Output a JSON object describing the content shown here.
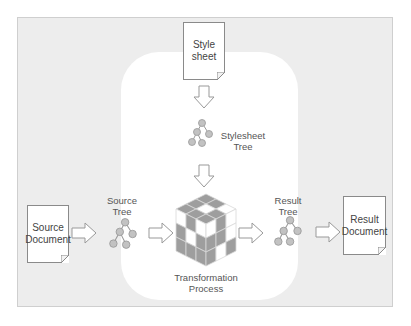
{
  "diagram": {
    "nodes": {
      "stylesheet_doc": {
        "label_line1": "Style",
        "label_line2": "sheet"
      },
      "stylesheet_tree": {
        "label_line1": "Stylesheet",
        "label_line2": "Tree"
      },
      "source_doc": {
        "label_line1": "Source",
        "label_line2": "Document"
      },
      "source_tree": {
        "label_line1": "Source",
        "label_line2": "Tree"
      },
      "transformation": {
        "label_line1": "Transformation",
        "label_line2": "Process"
      },
      "result_tree": {
        "label_line1": "Result",
        "label_line2": "Tree"
      },
      "result_doc": {
        "label_line1": "Result",
        "label_line2": "Document"
      }
    },
    "edges": [
      {
        "from": "stylesheet_doc",
        "to": "stylesheet_tree"
      },
      {
        "from": "stylesheet_tree",
        "to": "transformation"
      },
      {
        "from": "source_doc",
        "to": "source_tree"
      },
      {
        "from": "source_tree",
        "to": "transformation"
      },
      {
        "from": "transformation",
        "to": "result_tree"
      },
      {
        "from": "result_tree",
        "to": "result_doc"
      }
    ],
    "colors": {
      "outer_panel": "#ededed",
      "inner_panel": "#ffffff",
      "node_fill": "#bdbdbd",
      "cube_gray": "#9e9e9e",
      "cube_white": "#ffffff",
      "stroke": "#8a8a8a"
    }
  }
}
